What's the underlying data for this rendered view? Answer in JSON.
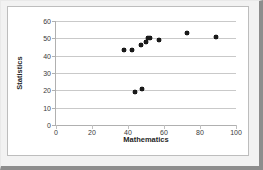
{
  "chart_data": {
    "type": "scatter",
    "title": "",
    "xlabel": "Mathematics",
    "ylabel": "Statistics",
    "xlim": [
      0,
      100
    ],
    "ylim": [
      0,
      60
    ],
    "xticks": [
      0,
      20,
      40,
      60,
      80,
      100
    ],
    "yticks": [
      0,
      10,
      20,
      30,
      40,
      50,
      60
    ],
    "xtick_labels": [
      "0",
      "20",
      "40",
      "60",
      "80",
      "100"
    ],
    "ytick_labels": [
      "0",
      "10",
      "20",
      "30",
      "40",
      "50",
      "60"
    ],
    "grid": "horizontal",
    "legend": "none",
    "marker": "diamond",
    "marker_color": "#1a1a1a",
    "series": [
      {
        "name": "Students",
        "points": [
          {
            "x": 38,
            "y": 43
          },
          {
            "x": 42,
            "y": 43
          },
          {
            "x": 44,
            "y": 19
          },
          {
            "x": 47,
            "y": 46
          },
          {
            "x": 48,
            "y": 21
          },
          {
            "x": 50,
            "y": 48
          },
          {
            "x": 51,
            "y": 50
          },
          {
            "x": 52,
            "y": 50
          },
          {
            "x": 57,
            "y": 49
          },
          {
            "x": 73,
            "y": 53
          },
          {
            "x": 89,
            "y": 51
          }
        ]
      }
    ]
  },
  "colors": {
    "gridline": "#c9c9c9",
    "axis": "#b0b0b0",
    "marker": "#1a1a1a",
    "frame": "#f2f2f2",
    "frame_shadow": "#8d8d8d",
    "plot_background": "#ffffff"
  }
}
